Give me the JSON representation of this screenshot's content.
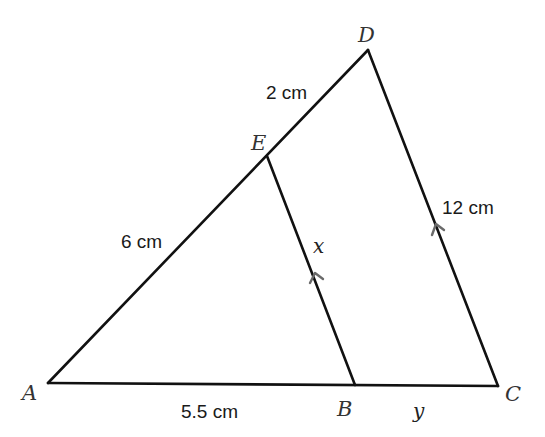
{
  "diagram": {
    "type": "geometry-similar-triangles",
    "vertices": {
      "A": {
        "label": "A",
        "x": 48,
        "y": 383
      },
      "B": {
        "label": "B",
        "x": 355,
        "y": 385
      },
      "C": {
        "label": "C",
        "x": 498,
        "y": 386
      },
      "D": {
        "label": "D",
        "x": 368,
        "y": 50
      },
      "E": {
        "label": "E",
        "x": 267,
        "y": 156
      }
    },
    "segments": [
      {
        "from": "A",
        "to": "D"
      },
      {
        "from": "D",
        "to": "C"
      },
      {
        "from": "A",
        "to": "C"
      },
      {
        "from": "E",
        "to": "B"
      }
    ],
    "parallel_markers": [
      {
        "segment": "EB"
      },
      {
        "segment": "DC"
      }
    ],
    "labels": {
      "ED": "2 cm",
      "AE": "6 cm",
      "DC": "12 cm",
      "AB": "5.5 cm",
      "EB": "x",
      "BC": "y"
    }
  }
}
